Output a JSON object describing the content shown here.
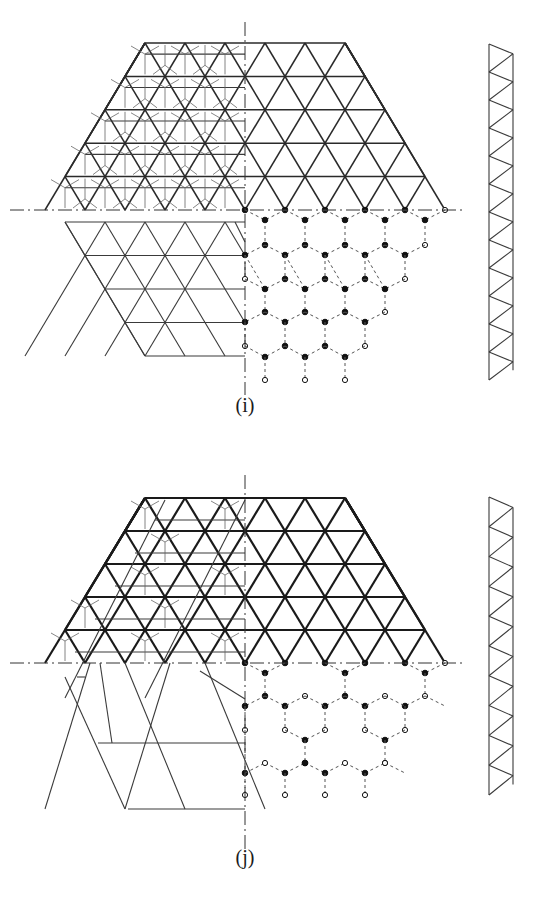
{
  "figure": {
    "panels": [
      {
        "id": "i",
        "label": "(i)",
        "label_pos": {
          "x": 245,
          "y": 408
        },
        "origin": {
          "cx": 245,
          "cy": 210
        },
        "grid": {
          "a": 40,
          "h": 33.4,
          "rows_above": 5,
          "top_half_width_units": 2.5,
          "bottom_half_width_units": 5
        },
        "upper_left_style": "double-layer with star bracing",
        "upper_right_style": "single-layer triangular grid",
        "lower_left_style": "offset triangular grid",
        "lower_left": {
          "first_row_y": 222,
          "first_row_x_left": 67,
          "rows": [
            222,
            255.5,
            289,
            322.5,
            356
          ],
          "bottom_x_left": 147
        },
        "lower_right_style": "honeycomb nodes",
        "vaxis": {
          "y1": 22,
          "y2": 395
        },
        "haxis": {
          "x1": 10,
          "x2": 466
        },
        "truss": {
          "x_left": 489,
          "x_right": 513,
          "y_top": 44,
          "y_bottom": 380,
          "panels": 12
        },
        "line_weight": "normal"
      },
      {
        "id": "j",
        "label": "(j)",
        "label_pos": {
          "x": 245,
          "y": 860
        },
        "origin": {
          "cx": 245,
          "cy": 663
        },
        "grid": {
          "a": 40,
          "h": 33,
          "rows_above": 5,
          "top_half_width_units": 2.5,
          "bottom_half_width_units": 5
        },
        "upper_left_style": "double-layer with sparse tripod bracing",
        "upper_right_style": "single-layer triangular grid (heavy)",
        "lower_left_style": "large triangular grid (2x module)",
        "lower_left": {
          "rows": [
            698,
            731,
            764,
            797,
            830
          ],
          "bottom_x_left": 127
        },
        "lower_right_style": "sparse honeycomb nodes",
        "vaxis": {
          "y1": 475,
          "y2": 850
        },
        "haxis": {
          "x1": 10,
          "x2": 466
        },
        "truss": {
          "x_left": 489,
          "x_right": 513,
          "y_top": 497,
          "y_bottom": 795,
          "panels": 10
        },
        "line_weight": "heavy"
      }
    ]
  }
}
